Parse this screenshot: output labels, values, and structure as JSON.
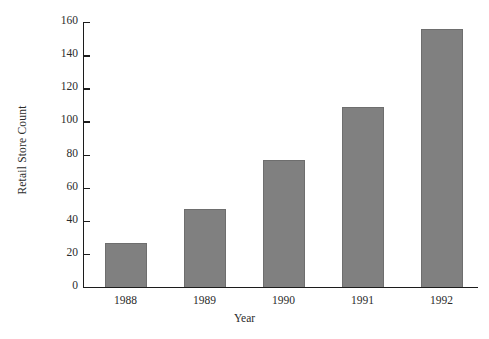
{
  "chart_data": {
    "type": "bar",
    "title": "",
    "subtitle": "",
    "xlabel": "Year",
    "ylabel": "Retail Store Count",
    "categories": [
      "1988",
      "1989",
      "1990",
      "1991",
      "1992"
    ],
    "values": [
      26.5,
      47,
      76.5,
      108.5,
      155.5
    ],
    "series": [
      {
        "name": "Retail Store Count",
        "values": [
          26.5,
          47,
          76.5,
          108.5,
          155.5
        ]
      }
    ],
    "ylim": [
      0,
      160
    ],
    "xlim_note": "categorical",
    "ytick_labels": [
      "0",
      "20",
      "40",
      "60",
      "80",
      "100",
      "120",
      "140",
      "160"
    ],
    "ytick_values": [
      0,
      20,
      40,
      60,
      80,
      100,
      120,
      140,
      160
    ],
    "ytick_step": 20,
    "xtick_labels": [
      "1988",
      "1989",
      "1990",
      "1991",
      "1992"
    ],
    "grid": false,
    "legend": false,
    "legend_position": "none",
    "annotations": [],
    "colors": {
      "bar_fill": "#808080",
      "bar_stroke": "#6e6e6e",
      "axis": "#1c1c1c",
      "text": "#2b2b2b",
      "background": "#ffffff"
    }
  }
}
